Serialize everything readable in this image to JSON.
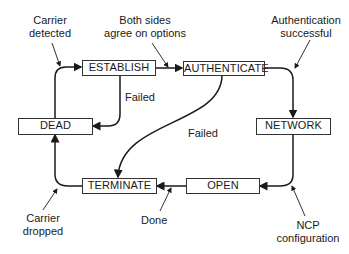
{
  "diagram": {
    "type": "state-machine",
    "states": [
      {
        "id": "establish",
        "label": "ESTABLISH"
      },
      {
        "id": "authenticate",
        "label": "AUTHENTICATE"
      },
      {
        "id": "dead",
        "label": "DEAD"
      },
      {
        "id": "network",
        "label": "NETWORK"
      },
      {
        "id": "terminate",
        "label": "TERMINATE"
      },
      {
        "id": "open",
        "label": "OPEN"
      }
    ],
    "annotations": {
      "carrier_detected": [
        "Carrier",
        "detected"
      ],
      "both_sides_agree": [
        "Both sides",
        "agree on options"
      ],
      "auth_successful": [
        "Authentication",
        "successful"
      ],
      "failed_establish": "Failed",
      "failed_authenticate": "Failed",
      "carrier_dropped": [
        "Carrier",
        "dropped"
      ],
      "done": "Done",
      "ncp_configuration": [
        "NCP",
        "configuration"
      ]
    },
    "transitions": [
      {
        "from": "dead",
        "to": "establish",
        "label": "Carrier detected"
      },
      {
        "from": "establish",
        "to": "authenticate",
        "label": "Both sides agree on options"
      },
      {
        "from": "establish",
        "to": "dead",
        "label": "Failed"
      },
      {
        "from": "authenticate",
        "to": "network",
        "label": "Authentication successful"
      },
      {
        "from": "authenticate",
        "to": "terminate",
        "label": "Failed"
      },
      {
        "from": "network",
        "to": "open",
        "label": "NCP configuration"
      },
      {
        "from": "open",
        "to": "terminate",
        "label": "Done"
      },
      {
        "from": "terminate",
        "to": "dead",
        "label": "Carrier dropped"
      }
    ],
    "colors": {
      "line": "#1a1a1a",
      "box_border": "#333333",
      "background": "#ffffff"
    }
  }
}
